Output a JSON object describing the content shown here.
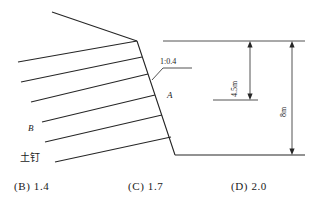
{
  "figure": {
    "name": "soil-nail-wall-excavation-section",
    "labels": {
      "slope_ratio": "1:0.4",
      "point_a": "A",
      "point_b": "B",
      "soil_nail": "土钉"
    },
    "dimensions": {
      "inner_depth": "4.5m",
      "outer_depth": "8m"
    },
    "colors": {
      "line": "#262626",
      "text": "#1a1a1a",
      "background": "#ffffff"
    },
    "geometry": {
      "ground_surface": [
        [
          52,
          12
        ],
        [
          137,
          41
        ]
      ],
      "excavation_face": [
        [
          137,
          41
        ],
        [
          175,
          155
        ]
      ],
      "excavation_base": [
        [
          175,
          155
        ],
        [
          305,
          155
        ]
      ],
      "soil_nails": [
        [
          [
            18,
            62
          ],
          [
            137,
            41
          ]
        ],
        [
          [
            21,
            82
          ],
          [
            142,
            57
          ]
        ],
        [
          [
            31,
            102
          ],
          [
            148,
            74
          ]
        ],
        [
          [
            42,
            122
          ],
          [
            155,
            95
          ]
        ],
        [
          [
            45,
            142
          ],
          [
            162,
            115
          ]
        ],
        [
          [
            55,
            162
          ],
          [
            171,
            137
          ]
        ]
      ],
      "leader_line": [
        [
          153,
          79
        ],
        [
          163,
          68
        ],
        [
          192,
          68
        ]
      ],
      "dim_line_inner": {
        "x": 250,
        "y_top": 41,
        "y_bottom": 100
      },
      "dim_line_outer": {
        "x": 292,
        "y_top": 41,
        "y_bottom": 155
      },
      "extension_top": [
        [
          163,
          41
        ],
        [
          305,
          41
        ]
      ],
      "extension_mid": [
        [
          213,
          100
        ],
        [
          258,
          100
        ]
      ]
    }
  },
  "options": {
    "items": [
      {
        "label": "(B) 1.4",
        "key": "B",
        "value": "1.4"
      },
      {
        "label": "(C) 1.7",
        "key": "C",
        "value": "1.7"
      },
      {
        "label": "(D) 2.0",
        "key": "D",
        "value": "2.0"
      }
    ]
  }
}
